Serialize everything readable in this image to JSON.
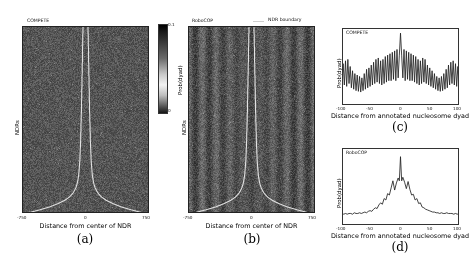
{
  "figure": {
    "panels": [
      {
        "tag": "(a)",
        "inset_label": "COMPETE"
      },
      {
        "tag": "(b)",
        "inset_label": "RoboCOP"
      },
      {
        "tag": "(c)",
        "inset_label": "COMPETE"
      },
      {
        "tag": "(d)",
        "inset_label": "RoboCOP"
      }
    ],
    "legend": {
      "label": "NDR boundary",
      "color": "#d9d9d9"
    },
    "colorbar": {
      "axis_label": "Prob(dyad)",
      "tick_top": "0.1",
      "tick_bottom": "0",
      "vmin": 0,
      "vmax": 0.1
    }
  },
  "chart_data": [
    {
      "type": "heatmap",
      "panel": "a",
      "title": "COMPETE",
      "xlabel": "Distance from center of NDR",
      "ylabel": "NDRs",
      "xticks": [
        -750,
        0,
        750
      ],
      "xticklabels": [
        "-750",
        "0",
        "750"
      ],
      "xlim": [
        -750,
        750
      ],
      "colorbar_label": "Prob(dyad)",
      "clim": [
        0,
        0.1
      ],
      "cmap": "gray_r",
      "overlay": "NDR boundary",
      "description": "Dyad probability heatmap across NDRs sorted by NDR width; diffuse near-uniform low signal with white NDR boundary curves flaring outward at the bottom",
      "ndr_boundary_halfwidth_by_row_px": [
        10,
        10,
        10,
        11,
        11,
        11,
        11,
        12,
        12,
        12,
        12,
        12,
        13,
        13,
        13,
        13,
        14,
        14,
        14,
        14,
        15,
        15,
        15,
        15,
        16,
        16,
        16,
        16,
        17,
        17,
        17,
        18,
        18,
        18,
        19,
        19,
        19,
        20,
        20,
        21,
        21,
        22,
        22,
        23,
        24,
        25,
        26,
        27,
        29,
        31,
        34,
        38,
        44,
        52,
        64,
        82,
        108,
        140,
        180,
        230
      ]
    },
    {
      "type": "heatmap",
      "panel": "b",
      "title": "RoboCOP",
      "xlabel": "Distance from center of NDR",
      "ylabel": "NDRs",
      "xticks": [
        -750,
        0,
        750
      ],
      "xticklabels": [
        "-750",
        "0",
        "750"
      ],
      "xlim": [
        -750,
        750
      ],
      "colorbar_label": "Prob(dyad)",
      "clim": [
        0,
        0.1
      ],
      "cmap": "gray_r",
      "overlay": "NDR boundary",
      "description": "Dyad probability heatmap across NDRs showing vertical phased nucleosome arrays flanking a depleted central NDR region, with white NDR boundary curves",
      "ndr_boundary_halfwidth_by_row_px": [
        10,
        10,
        10,
        11,
        11,
        11,
        11,
        12,
        12,
        12,
        12,
        12,
        13,
        13,
        13,
        13,
        14,
        14,
        14,
        14,
        15,
        15,
        15,
        15,
        16,
        16,
        16,
        16,
        17,
        17,
        17,
        18,
        18,
        18,
        19,
        19,
        19,
        20,
        20,
        21,
        21,
        22,
        22,
        23,
        24,
        25,
        26,
        27,
        29,
        31,
        34,
        38,
        44,
        52,
        64,
        82,
        108,
        140,
        180,
        230
      ]
    },
    {
      "type": "line",
      "panel": "c",
      "title": "COMPETE",
      "xlabel": "Distance from annotated nucleosome dyad",
      "ylabel": "Prob(dyad)",
      "xticks": [
        -100,
        -50,
        0,
        50,
        100
      ],
      "xticklabels": [
        "-100",
        "-50",
        "0",
        "50",
        "100"
      ],
      "xlim": [
        -100,
        100
      ],
      "ylim": [
        0,
        1
      ],
      "grid": false,
      "series": [
        {
          "name": "COMPETE",
          "color": "#222222",
          "note": "high-frequency ~10 bp oscillation spanning the full window with a single tall spike at x=0; oscillation amplitude decays only modestly away from centre",
          "x": [
            -100,
            -98,
            -96,
            -94,
            -92,
            -90,
            -88,
            -86,
            -84,
            -82,
            -80,
            -78,
            -76,
            -74,
            -72,
            -70,
            -68,
            -66,
            -64,
            -62,
            -60,
            -58,
            -56,
            -54,
            -52,
            -50,
            -48,
            -46,
            -44,
            -42,
            -40,
            -38,
            -36,
            -34,
            -32,
            -30,
            -28,
            -26,
            -24,
            -22,
            -20,
            -18,
            -16,
            -14,
            -12,
            -10,
            -8,
            -6,
            -4,
            -2,
            0,
            2,
            4,
            6,
            8,
            10,
            12,
            14,
            16,
            18,
            20,
            22,
            24,
            26,
            28,
            30,
            32,
            34,
            36,
            38,
            40,
            42,
            44,
            46,
            48,
            50,
            52,
            54,
            56,
            58,
            60,
            62,
            64,
            66,
            68,
            70,
            72,
            74,
            76,
            78,
            80,
            82,
            84,
            86,
            88,
            90,
            92,
            94,
            96,
            98,
            100
          ],
          "y": [
            0.3,
            0.54,
            0.24,
            0.58,
            0.22,
            0.6,
            0.26,
            0.5,
            0.2,
            0.44,
            0.18,
            0.4,
            0.16,
            0.38,
            0.15,
            0.36,
            0.14,
            0.34,
            0.16,
            0.4,
            0.18,
            0.46,
            0.2,
            0.48,
            0.22,
            0.52,
            0.24,
            0.56,
            0.26,
            0.6,
            0.28,
            0.62,
            0.26,
            0.58,
            0.24,
            0.6,
            0.26,
            0.64,
            0.28,
            0.66,
            0.3,
            0.68,
            0.3,
            0.7,
            0.32,
            0.72,
            0.3,
            0.74,
            0.34,
            0.66,
            0.97,
            0.66,
            0.34,
            0.74,
            0.3,
            0.72,
            0.32,
            0.7,
            0.3,
            0.68,
            0.3,
            0.66,
            0.28,
            0.64,
            0.26,
            0.6,
            0.24,
            0.58,
            0.26,
            0.62,
            0.28,
            0.6,
            0.26,
            0.52,
            0.24,
            0.48,
            0.22,
            0.44,
            0.2,
            0.4,
            0.18,
            0.36,
            0.16,
            0.34,
            0.15,
            0.36,
            0.16,
            0.4,
            0.18,
            0.46,
            0.2,
            0.52,
            0.24,
            0.56,
            0.26,
            0.58,
            0.24,
            0.54,
            0.22,
            0.5,
            0.28
          ]
        }
      ]
    },
    {
      "type": "line",
      "panel": "d",
      "title": "RoboCOP",
      "xlabel": "Distance from annotated nucleosome dyad",
      "ylabel": "Prob(dyad)",
      "xticks": [
        -100,
        -50,
        0,
        50,
        100
      ],
      "xticklabels": [
        "-100",
        "-50",
        "0",
        "50",
        "100"
      ],
      "xlim": [
        -100,
        100
      ],
      "ylim": [
        0,
        1
      ],
      "grid": false,
      "series": [
        {
          "name": "RoboCOP",
          "color": "#222222",
          "note": "broad bell-shaped envelope centred at 0 with a sharp central spike and two flanking shoulder peaks near -12 and +12; flat low baseline beyond +/-60",
          "x": [
            -100,
            -97,
            -94,
            -91,
            -88,
            -85,
            -82,
            -79,
            -76,
            -73,
            -70,
            -67,
            -64,
            -61,
            -58,
            -55,
            -52,
            -49,
            -46,
            -43,
            -40,
            -37,
            -34,
            -31,
            -28,
            -25,
            -22,
            -19,
            -16,
            -13,
            -10,
            -7,
            -4,
            -2,
            0,
            2,
            4,
            7,
            10,
            13,
            16,
            19,
            22,
            25,
            28,
            31,
            34,
            37,
            40,
            43,
            46,
            49,
            52,
            55,
            58,
            61,
            64,
            67,
            70,
            73,
            76,
            79,
            82,
            85,
            88,
            91,
            94,
            97,
            100
          ],
          "y": [
            0.12,
            0.11,
            0.12,
            0.11,
            0.12,
            0.12,
            0.11,
            0.13,
            0.12,
            0.12,
            0.13,
            0.12,
            0.13,
            0.14,
            0.13,
            0.15,
            0.16,
            0.15,
            0.18,
            0.2,
            0.19,
            0.24,
            0.27,
            0.25,
            0.33,
            0.31,
            0.4,
            0.38,
            0.48,
            0.58,
            0.45,
            0.55,
            0.62,
            0.58,
            0.92,
            0.58,
            0.63,
            0.56,
            0.47,
            0.57,
            0.46,
            0.38,
            0.39,
            0.31,
            0.33,
            0.26,
            0.27,
            0.21,
            0.2,
            0.18,
            0.17,
            0.16,
            0.15,
            0.14,
            0.14,
            0.13,
            0.13,
            0.12,
            0.13,
            0.12,
            0.12,
            0.13,
            0.12,
            0.12,
            0.12,
            0.11,
            0.12,
            0.11,
            0.12
          ]
        }
      ]
    }
  ]
}
